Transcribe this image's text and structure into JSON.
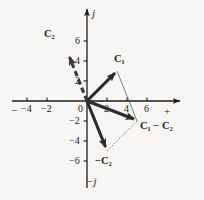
{
  "figure": {
    "kind": "vector-diagram",
    "background_color": "#f7f6f4",
    "ink_color": "#1b1b1b",
    "origin_px": {
      "x": 87,
      "y": 101
    },
    "units_per_px": 10
  },
  "axes": {
    "horizontal": {
      "label_positive": "+",
      "label_negative": "−",
      "ticks": [
        {
          "value": -4,
          "label": "−4"
        },
        {
          "value": -2,
          "label": "−2"
        },
        {
          "value": 0,
          "label": "0"
        },
        {
          "value": 2,
          "label": "2"
        },
        {
          "value": 4,
          "label": "4"
        },
        {
          "value": 6,
          "label": "6"
        }
      ]
    },
    "vertical": {
      "label_positive": "j",
      "label_negative": "−j",
      "ticks": [
        {
          "value": 6,
          "label": "6"
        },
        {
          "value": 4,
          "label": "4"
        },
        {
          "value": 2,
          "label": "2"
        },
        {
          "value": -2,
          "label": "−2"
        },
        {
          "value": -4,
          "label": "−4"
        },
        {
          "value": -6,
          "label": "−6"
        }
      ]
    }
  },
  "vectors": [
    {
      "id": "c1",
      "label_main": "C",
      "label_sub": "1",
      "style": "solid",
      "tip": {
        "x": 3,
        "y": 3
      }
    },
    {
      "id": "c2",
      "label_main": "C",
      "label_sub": "2",
      "style": "dashed",
      "tip": {
        "x": -2,
        "y": 5
      }
    },
    {
      "id": "neg-c2",
      "label_prefix": "−",
      "label_main": "C",
      "label_sub": "2",
      "style": "solid",
      "tip": {
        "x": 2,
        "y": -5
      }
    },
    {
      "id": "c1-minus-c2",
      "label_main": "C",
      "label_sub": "1",
      "label_op": "−",
      "label_main2": "C",
      "label_sub2": "2",
      "style": "solid",
      "tip": {
        "x": 5,
        "y": -2
      }
    }
  ],
  "construction_lines": [
    {
      "id": "c1-to-sum",
      "from": {
        "x": 3,
        "y": 3
      },
      "to": {
        "x": 5,
        "y": -2
      },
      "style": "thin-solid"
    },
    {
      "id": "negc2-to-sum",
      "from": {
        "x": 2,
        "y": -5
      },
      "to": {
        "x": 5,
        "y": -2
      },
      "style": "thin-dotted"
    }
  ],
  "labels": {
    "c1": "C₁",
    "c2": "C₂",
    "neg_c2": "−C₂",
    "c1_minus_c2": "C₁ − C₂",
    "axis_j": "j",
    "axis_neg_j": "−j",
    "axis_plus": "+",
    "axis_minus": "−",
    "zero": "0",
    "x_neg4": "−4",
    "x_neg2": "−2",
    "x_2": "2",
    "x_4": "4",
    "x_6": "6",
    "y_2": "2",
    "y_4": "4",
    "y_6": "6",
    "y_neg2": "−2",
    "y_neg4": "−4",
    "y_neg6": "−6"
  }
}
